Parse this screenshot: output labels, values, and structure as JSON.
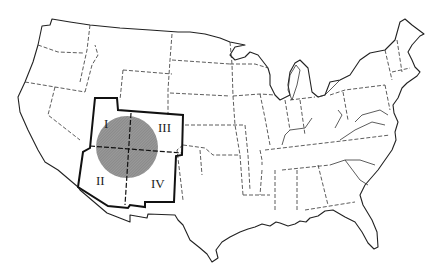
{
  "map": {
    "title": "Four Corners region of the United States",
    "highlight_circle_color": "#8c8c8c",
    "quadrant_labels": {
      "q1": "I",
      "q2": "II",
      "q3": "III",
      "q4": "IV"
    }
  }
}
